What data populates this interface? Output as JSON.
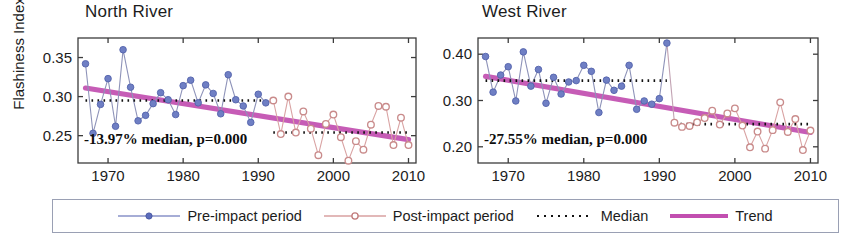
{
  "figure": {
    "ylabel": "Flashiness Index",
    "legend": {
      "items": [
        {
          "label": "Pre-impact period",
          "marker": "filled-circle",
          "color": "#6f7fc4",
          "line_color": "#8892c8"
        },
        {
          "label": "Post-impact period",
          "marker": "open-circle",
          "color": "#c98b8b",
          "line_color": "#d8a0a0"
        },
        {
          "label": "Median",
          "marker": "dotted-line",
          "color": "#111111",
          "line_color": "#111111"
        },
        {
          "label": "Trend",
          "marker": "thick-line",
          "color": "#c24fb0",
          "line_color": "#c24fb0"
        }
      ]
    }
  },
  "chart_data": [
    {
      "type": "line",
      "title": "North River",
      "xlabel": "",
      "ylabel": "Flashiness Index",
      "xlim": [
        1966,
        2011
      ],
      "ylim": [
        0.215,
        0.375
      ],
      "xticks": [
        1970,
        1980,
        1990,
        2000,
        2010
      ],
      "yticks": [
        0.25,
        0.3,
        0.35
      ],
      "ytick_labels": [
        "0.25",
        "0.30",
        "0.35"
      ],
      "xtick_labels": [
        "1970",
        "1980",
        "1990",
        "2000",
        "2010"
      ],
      "grid": false,
      "annotation": "-13.97% median, p=0.000",
      "series": [
        {
          "name": "Pre-impact period",
          "marker": "filled-circle",
          "color": "#6f7fc4",
          "x": [
            1967,
            1968,
            1969,
            1970,
            1971,
            1972,
            1973,
            1974,
            1975,
            1976,
            1977,
            1978,
            1979,
            1980,
            1981,
            1982,
            1983,
            1984,
            1985,
            1986,
            1987,
            1988,
            1989,
            1990,
            1991
          ],
          "values": [
            0.342,
            0.253,
            0.29,
            0.323,
            0.262,
            0.36,
            0.312,
            0.269,
            0.276,
            0.291,
            0.305,
            0.296,
            0.277,
            0.314,
            0.321,
            0.292,
            0.315,
            0.304,
            0.278,
            0.328,
            0.296,
            0.288,
            0.267,
            0.303,
            0.292
          ]
        },
        {
          "name": "Post-impact period",
          "marker": "open-circle",
          "color": "#c98b8b",
          "x": [
            1992,
            1993,
            1994,
            1995,
            1996,
            1997,
            1998,
            1999,
            2000,
            2001,
            2002,
            2003,
            2004,
            2005,
            2006,
            2007,
            2008,
            2009,
            2010
          ],
          "values": [
            0.295,
            0.252,
            0.3,
            0.254,
            0.281,
            0.259,
            0.225,
            0.265,
            0.277,
            0.248,
            0.218,
            0.243,
            0.232,
            0.264,
            0.288,
            0.287,
            0.238,
            0.273,
            0.238
          ]
        }
      ],
      "median_segments": [
        {
          "name": "Pre-impact median",
          "x0": 1967,
          "x1": 1991,
          "y": 0.295
        },
        {
          "name": "Post-impact median",
          "x0": 1992,
          "x1": 2010,
          "y": 0.254
        }
      ],
      "trend": {
        "name": "Trend",
        "x0": 1967,
        "y0": 0.311,
        "x1": 2010,
        "y1": 0.245,
        "color": "#c24fb0"
      }
    },
    {
      "type": "line",
      "title": "West River",
      "xlabel": "",
      "ylabel": "",
      "xlim": [
        1966,
        2011
      ],
      "ylim": [
        0.165,
        0.435
      ],
      "xticks": [
        1970,
        1980,
        1990,
        2000,
        2010
      ],
      "yticks": [
        0.2,
        0.3,
        0.4
      ],
      "ytick_labels": [
        "0.20",
        "0.30",
        "0.40"
      ],
      "xtick_labels": [
        "1970",
        "1980",
        "1990",
        "2000",
        "2010"
      ],
      "grid": false,
      "annotation": "-27.55% median, p=0.000",
      "series": [
        {
          "name": "Pre-impact period",
          "marker": "filled-circle",
          "color": "#6f7fc4",
          "x": [
            1967,
            1968,
            1969,
            1970,
            1971,
            1972,
            1973,
            1974,
            1975,
            1976,
            1977,
            1978,
            1979,
            1980,
            1981,
            1982,
            1983,
            1984,
            1985,
            1986,
            1987,
            1988,
            1989,
            1990,
            1991
          ],
          "values": [
            0.395,
            0.318,
            0.355,
            0.373,
            0.299,
            0.405,
            0.331,
            0.367,
            0.294,
            0.35,
            0.314,
            0.34,
            0.343,
            0.376,
            0.363,
            0.274,
            0.344,
            0.322,
            0.331,
            0.376,
            0.281,
            0.299,
            0.292,
            0.304,
            0.424
          ]
        },
        {
          "name": "Post-impact period",
          "marker": "open-circle",
          "color": "#c98b8b",
          "x": [
            1992,
            1993,
            1994,
            1995,
            1996,
            1997,
            1998,
            1999,
            2000,
            2001,
            2002,
            2003,
            2004,
            2005,
            2006,
            2007,
            2008,
            2009,
            2010
          ],
          "values": [
            0.252,
            0.243,
            0.245,
            0.253,
            0.262,
            0.278,
            0.248,
            0.272,
            0.283,
            0.246,
            0.199,
            0.233,
            0.196,
            0.236,
            0.296,
            0.232,
            0.26,
            0.193,
            0.235
          ]
        }
      ],
      "median_segments": [
        {
          "name": "Pre-impact median",
          "x0": 1967,
          "x1": 1991,
          "y": 0.343
        },
        {
          "name": "Post-impact median",
          "x0": 1992,
          "x1": 2010,
          "y": 0.249
        }
      ],
      "trend": {
        "name": "Trend",
        "x0": 1967,
        "y0": 0.352,
        "x1": 2010,
        "y1": 0.231,
        "color": "#c24fb0"
      }
    }
  ]
}
